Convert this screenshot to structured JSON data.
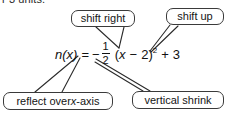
{
  "page": {
    "background_color": "#ffffff",
    "ink_color": "#1a1a1a",
    "top_text": "r 3 units."
  },
  "equation": {
    "function_name": "n",
    "variable": "x",
    "lhs": "n(x)",
    "equals": "=",
    "leading_minus": "−",
    "coefficient_numerator": "1",
    "coefficient_denominator": "2",
    "open_paren": "(",
    "inner_variable": "x",
    "inner_minus": "−",
    "inner_constant": "2",
    "close_paren": ")",
    "exponent": "2",
    "plus": "+",
    "vertical_shift": "3",
    "full_text": "n(x) = -1/2 (x - 2)^2 + 3"
  },
  "callouts": [
    {
      "id": "shift-right",
      "label": "shift right",
      "targets": "inner constant 2"
    },
    {
      "id": "shift-up",
      "label": "shift up",
      "targets": "+ 3"
    },
    {
      "id": "reflect-over-x-axis",
      "label_prefix": "reflect over ",
      "label_italic": "x",
      "label_suffix": "-axis",
      "label": "reflect over x-axis",
      "targets": "leading minus sign"
    },
    {
      "id": "vertical-shrink",
      "label": "vertical shrink",
      "targets": "fraction 1/2"
    }
  ],
  "connectors": {
    "stroke_color": "#2b2b2b",
    "stroke_width": 1,
    "count": 6
  }
}
